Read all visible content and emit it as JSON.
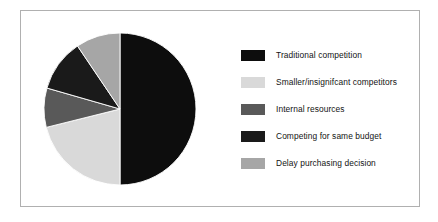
{
  "figure": {
    "frame_border_color": "#b0b0b0",
    "background_color": "#ffffff"
  },
  "chart_data": {
    "type": "pie",
    "title": "",
    "subtitle": "",
    "xlabel": "",
    "ylabel": "",
    "grid": false,
    "legend_position": "right",
    "start_angle_deg": 0,
    "direction": "clockwise",
    "center": {
      "x": 110,
      "y": 104
    },
    "radius": 76,
    "categories": [
      "Traditional competition",
      "Smaller/insignifcant competitors",
      "Internal resources",
      "Competing for same budget",
      "Delay purchasing decision"
    ],
    "values": [
      50,
      21,
      8,
      11,
      10
    ],
    "angles_deg": [
      180,
      76,
      30,
      40,
      34
    ],
    "colors": [
      "#0d0d0d",
      "#d9d9d9",
      "#595959",
      "#1a1a1a",
      "#a6a6a6"
    ],
    "slices": [
      {
        "label": "Traditional competition",
        "value": 50,
        "angle_deg": 180,
        "color": "#0d0d0d"
      },
      {
        "label": "Smaller/insignifcant competitors",
        "value": 21,
        "angle_deg": 76,
        "color": "#d9d9d9"
      },
      {
        "label": "Internal resources",
        "value": 8,
        "angle_deg": 30,
        "color": "#595959"
      },
      {
        "label": "Competing for same budget",
        "value": 11,
        "angle_deg": 40,
        "color": "#1a1a1a"
      },
      {
        "label": "Delay purchasing decision",
        "value": 10,
        "angle_deg": 34,
        "color": "#a6a6a6"
      }
    ],
    "annotations": []
  },
  "legend": {
    "entries": [
      {
        "label": "Traditional competition",
        "color": "#0d0d0d"
      },
      {
        "label": "Smaller/insignifcant competitors",
        "color": "#d9d9d9"
      },
      {
        "label": "Internal resources",
        "color": "#595959"
      },
      {
        "label": "Competing for same budget",
        "color": "#1a1a1a"
      },
      {
        "label": "Delay purchasing decision",
        "color": "#a6a6a6"
      }
    ]
  }
}
